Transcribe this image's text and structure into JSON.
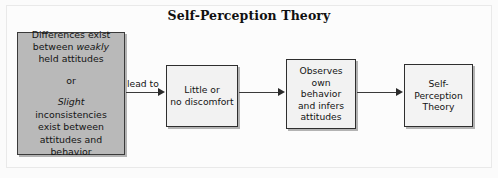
{
  "figure": {
    "title": "Self-Perception Theory",
    "background_color": "#fbfbfb",
    "frame_color": "#e9e9e9"
  },
  "nodes": {
    "premise": {
      "fill_color": "#b9b9b9",
      "border_color": "#3a3a3a",
      "line1": "Differences exist",
      "line2_prefix": "between ",
      "line2_italic": "weakly",
      "line3": "held attitudes",
      "line4": "or",
      "line5_italic": "Slight",
      "line5_suffix": " inconsistencies",
      "line6": "exist between",
      "line7": "attitudes and",
      "line8": "behavior"
    },
    "discomfort": {
      "fill_color": "#f2f2f2",
      "border_color": "#2e2e2e",
      "line1": "Little or",
      "line2": "no discomfort"
    },
    "observes": {
      "fill_color": "#f2f2f2",
      "border_color": "#2e2e2e",
      "line1": "Observes",
      "line2": "own behavior",
      "line3": "and infers",
      "line4": "attitudes"
    },
    "theory": {
      "fill_color": "#f3f3f3",
      "border_color": "#2e2e2e",
      "line1": "Self-",
      "line2": "Perception",
      "line3": "Theory"
    }
  },
  "connectors": {
    "lead_to_label": "lead to",
    "arrow_color": "#2b2b2b"
  }
}
